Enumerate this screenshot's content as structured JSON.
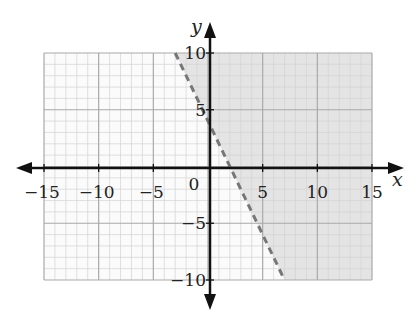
{
  "chart_data": {
    "type": "inequality-region",
    "title": "",
    "xlabel": "x",
    "ylabel": "y",
    "xlim": [
      -15,
      15
    ],
    "ylim": [
      -10,
      10
    ],
    "x_ticks": [
      -15,
      -10,
      -5,
      0,
      5,
      10,
      15
    ],
    "x_tick_labels": [
      "−15",
      "−10",
      "−5",
      "0",
      "5",
      "10",
      "15"
    ],
    "y_ticks": [
      -10,
      -5,
      5,
      10
    ],
    "y_tick_labels": [
      "−10",
      "−5",
      "5",
      "10"
    ],
    "grid": {
      "minor_step": 1,
      "major_step": 5
    },
    "boundary_line": {
      "equation": "y = -2x + 4",
      "slope": -2,
      "intercept": 4,
      "style": "dashed",
      "points": [
        [
          -3,
          10
        ],
        [
          7,
          -10
        ]
      ]
    },
    "inequality": "y > -2x + 4",
    "shaded_side": "above-right",
    "colors": {
      "shade": "#e4e4e4",
      "background": "#fbfbfb",
      "minor_grid": "#d2d2d2",
      "major_grid": "#a9a9a9",
      "axis": "#111111",
      "boundary": "#777777"
    }
  },
  "layout": {
    "plot_left": 44,
    "plot_right": 372,
    "plot_top": 53,
    "plot_bottom": 280,
    "origin_x": 210,
    "origin_y": 168
  }
}
